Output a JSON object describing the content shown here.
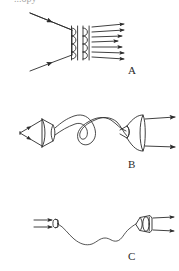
{
  "figure": {
    "background_color": "#ffffff",
    "ink_color": "#2b2b2b",
    "width": 179,
    "height": 271,
    "cropped_heading_text": "...opy",
    "panels": [
      {
        "id": "A",
        "label": "A",
        "label_x": 128,
        "label_y": 64,
        "description": "Two converging incident rays strike a pair of vertical coil windings; a fan of horizontal arrows emerges to the right",
        "incoming_ray_count": 2,
        "coil_columns": 2,
        "coil_loops_per_column": 4,
        "outgoing_ray_count": 7
      },
      {
        "id": "B",
        "label": "B",
        "label_x": 128,
        "label_y": 158,
        "description": "Left cone/funnel with converging rays, a looped coiled tube in the middle, and a right cone/funnel emitting two arrows",
        "incoming_ray_count": 2,
        "outgoing_ray_count": 2,
        "connector": "looped-tube"
      },
      {
        "id": "C",
        "label": "C",
        "label_x": 128,
        "label_y": 250,
        "description": "Two arrows enter a small circular aperture, a thin wavy fiber runs to a barrel-shaped emitter that sends out two arrows",
        "incoming_ray_count": 2,
        "outgoing_ray_count": 2,
        "connector": "wavy-fiber"
      }
    ]
  }
}
